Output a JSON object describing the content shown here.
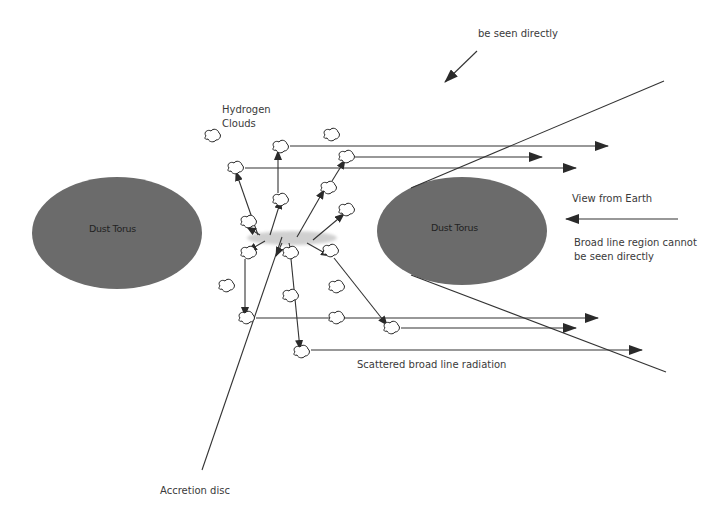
{
  "diagram": {
    "colors": {
      "background": "#ffffff",
      "torus_fill": "#6b6b6b",
      "line": "#333333",
      "accretion_disc_glow": "#d0d0d0",
      "text": "#3a3a3a"
    },
    "labels": {
      "top_note": "be seen directly",
      "hydrogen_line1": "Hydrogen",
      "hydrogen_line2": "Clouds",
      "torus_left": "Dust Torus",
      "torus_right": "Dust Torus",
      "view_from_earth": "View  from Earth",
      "blr_line1": "Broad line region cannot",
      "blr_line2": "be seen directly",
      "scattered": "Scattered broad line radiation",
      "accretion_disc": "Accretion disc"
    },
    "tori": [
      {
        "name": "left",
        "cx": 117,
        "cy": 233,
        "rx": 85,
        "ry": 56
      },
      {
        "name": "right",
        "cx": 462,
        "cy": 231,
        "rx": 85,
        "ry": 54
      }
    ],
    "accretion_disc": {
      "cx": 292,
      "cy": 238,
      "rx": 45,
      "ry": 7
    },
    "clouds": [
      {
        "x": 212,
        "y": 136
      },
      {
        "x": 331,
        "y": 135
      },
      {
        "x": 280,
        "y": 147
      },
      {
        "x": 346,
        "y": 157
      },
      {
        "x": 235,
        "y": 168
      },
      {
        "x": 328,
        "y": 188
      },
      {
        "x": 280,
        "y": 200
      },
      {
        "x": 346,
        "y": 210
      },
      {
        "x": 248,
        "y": 222
      },
      {
        "x": 248,
        "y": 253
      },
      {
        "x": 290,
        "y": 253
      },
      {
        "x": 330,
        "y": 251
      },
      {
        "x": 226,
        "y": 286
      },
      {
        "x": 290,
        "y": 296
      },
      {
        "x": 336,
        "y": 287
      },
      {
        "x": 246,
        "y": 318
      },
      {
        "x": 336,
        "y": 318
      },
      {
        "x": 391,
        "y": 328
      },
      {
        "x": 301,
        "y": 352
      }
    ],
    "radial_arrows": [
      {
        "x1": 258,
        "y1": 235,
        "x2": 236,
        "y2": 172
      },
      {
        "x1": 270,
        "y1": 235,
        "x2": 281,
        "y2": 200
      },
      {
        "x1": 278,
        "y1": 193,
        "x2": 278,
        "y2": 151
      },
      {
        "x1": 297,
        "y1": 237,
        "x2": 324,
        "y2": 190
      },
      {
        "x1": 332,
        "y1": 181,
        "x2": 345,
        "y2": 160
      },
      {
        "x1": 313,
        "y1": 240,
        "x2": 344,
        "y2": 214
      },
      {
        "x1": 260,
        "y1": 235,
        "x2": 247,
        "y2": 227
      },
      {
        "x1": 265,
        "y1": 241,
        "x2": 248,
        "y2": 251
      },
      {
        "x1": 282,
        "y1": 243,
        "x2": 276,
        "y2": 256
      },
      {
        "x1": 289,
        "y1": 243,
        "x2": 292,
        "y2": 256
      },
      {
        "x1": 307,
        "y1": 243,
        "x2": 330,
        "y2": 256
      },
      {
        "x1": 245,
        "y1": 259,
        "x2": 245,
        "y2": 316
      },
      {
        "x1": 291,
        "y1": 259,
        "x2": 300,
        "y2": 349
      },
      {
        "x1": 334,
        "y1": 258,
        "x2": 387,
        "y2": 325
      }
    ],
    "scatter_arrows": [
      {
        "x1": 290,
        "y1": 146,
        "x2": 608,
        "y2": 146
      },
      {
        "x1": 355,
        "y1": 157,
        "x2": 542,
        "y2": 157
      },
      {
        "x1": 245,
        "y1": 168,
        "x2": 576,
        "y2": 168
      },
      {
        "x1": 256,
        "y1": 318,
        "x2": 598,
        "y2": 318
      },
      {
        "x1": 401,
        "y1": 328,
        "x2": 576,
        "y2": 328
      },
      {
        "x1": 311,
        "y1": 350,
        "x2": 642,
        "y2": 350
      }
    ],
    "plain_lines": [
      {
        "name": "cone-upper",
        "x1": 411,
        "y1": 188,
        "x2": 664,
        "y2": 81
      },
      {
        "name": "cone-lower",
        "x1": 411,
        "y1": 275,
        "x2": 666,
        "y2": 372
      },
      {
        "name": "accretion-pointer",
        "x1": 282,
        "y1": 237,
        "x2": 202,
        "y2": 470
      }
    ],
    "pointer_arrows": [
      {
        "name": "top-note-arrow",
        "x1": 477,
        "y1": 51,
        "x2": 445,
        "y2": 82
      },
      {
        "name": "earth-view-arrow",
        "x1": 678,
        "y1": 219,
        "x2": 566,
        "y2": 219
      }
    ],
    "label_positions": {
      "top_note": {
        "x": 478,
        "y": 27
      },
      "hydrogen": {
        "x": 222,
        "y": 103
      },
      "torus_left": {
        "x": 89,
        "y": 223
      },
      "torus_right": {
        "x": 431,
        "y": 222
      },
      "view_from_earth": {
        "x": 572,
        "y": 192
      },
      "blr": {
        "x": 574,
        "y": 236
      },
      "scattered": {
        "x": 357,
        "y": 358
      },
      "accretion_disc": {
        "x": 160,
        "y": 484
      }
    }
  }
}
